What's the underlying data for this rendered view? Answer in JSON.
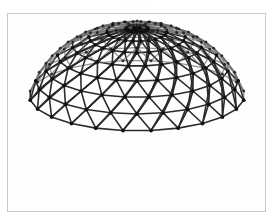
{
  "page": {
    "width": 275,
    "height": 222,
    "background_color": "#ffffff"
  },
  "caption_remnant": {
    "text": "· · ·",
    "note": "faint clipped text row from the line above the figure"
  },
  "figure": {
    "name": "geodesic-dome-photograph",
    "frame": {
      "x": 7,
      "y": 13,
      "width": 259,
      "height": 199,
      "border_color": "#c9c9c9",
      "background_color": "#fefefe"
    },
    "colors": {
      "strut": "#2b2b2b",
      "strut_light": "#6a6a6a",
      "node": "#111111",
      "background": "#fefefe"
    },
    "geometry": {
      "center_x": 137,
      "center_y": 118,
      "radius_x": 112,
      "radius_y": 98,
      "tilt_degrees": 22,
      "latitude_rings": 7,
      "meridian_count": 24,
      "top_clipped": true,
      "bottom_rim_y": 200,
      "left_edge_x": 25,
      "right_edge_x": 248,
      "strut_width": 1.6,
      "node_radius": 1.9
    }
  }
}
